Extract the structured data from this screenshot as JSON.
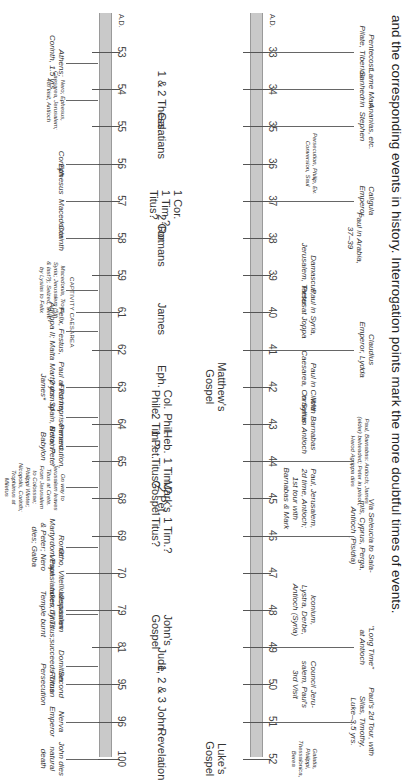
{
  "header": {
    "text": "and the corresponding events in history. Interrogation points mark the more doubtful times of events."
  },
  "timelines": [
    {
      "id": "upper",
      "era_label": "A.D.",
      "years": [
        "33",
        "34",
        "35",
        "36",
        "37",
        "38",
        "39",
        "40",
        "41",
        "42",
        "43",
        "44",
        "45",
        "46",
        "47",
        "48",
        "49",
        "50",
        "51",
        "52"
      ],
      "books": [
        {
          "text": "Matthew's\nGospel",
          "year_index": 9
        },
        {
          "text": "Luke's\nGospel",
          "year_index": 19
        }
      ],
      "events_above": [
        {
          "text": "Pentecost\nPilate, Tiberius",
          "year_index": 0
        },
        {
          "text": "Lame Man,\nSanhedrin",
          "year_index": 1
        },
        {
          "text": "Ananias, etc.\nStephen",
          "year_index": 2
        },
        {
          "text": "Caligula\nEmperor",
          "year_index": 4
        },
        {
          "text": "Claudius\nEmperor, Lydda",
          "year_index": 8
        },
        {
          "text": "Paul, Barnabas: Antioch; James\n(elder) beheaded; Peter in prison;\nHerod Agrippa dies",
          "year_index": 11,
          "small": true
        },
        {
          "text": "Via Seleucia to Sala-\nmis, Cyprus, Perga,\nAntioch (Pisidia)",
          "year_index": 13
        },
        {
          "text": "\"Long Time\"\nat Antioch",
          "year_index": 16
        },
        {
          "text": "Paul's 2d Tour, with\nSilas, Timothy,\nLuke–3.5 yrs.",
          "year_index": 18
        }
      ],
      "events_mid": [
        {
          "text": "Persecution, Philip, Ev.\nConversion, Saul",
          "year_index": 3,
          "small": true
        },
        {
          "text": "Paul in Arabia,\n37–39",
          "year_index": 5
        },
        {
          "text": "Damascus,\nJerusalem, Tarsus",
          "year_index": 6
        },
        {
          "text": "Paul in Syria,\nPeter at Joppa",
          "year_index": 7
        },
        {
          "text": "Paul in Cilicia\nCaesarea, Cornelius",
          "year_index": 9
        },
        {
          "text": "With Barnabas\nin Syrian Antioch",
          "year_index": 10
        },
        {
          "text": "Paul, Jerusalem,\n2d time, Antioch;\n1st tour with\nBarnabas & Mark",
          "year_index": 12
        },
        {
          "text": "Iconium,\nLystra, Derbe,\nAntioch (Syria)",
          "year_index": 15
        },
        {
          "text": "Council Jeru-\nsalem, Paul's\n3rd Visit",
          "year_index": 17
        },
        {
          "text": "Galatia,\nPhilippi,\nThessalonica,\nBerea",
          "year_index": 19,
          "small": true
        }
      ]
    },
    {
      "id": "lower",
      "era_label": "A.D.",
      "years": [
        "53",
        "54",
        "55",
        "56",
        "57",
        "58",
        "59",
        "61",
        "62",
        "63",
        "64",
        "65",
        "68",
        "69",
        "70",
        "79",
        "81",
        "95",
        "96",
        "100"
      ],
      "books": [
        {
          "text": "1 & 2 Thess.",
          "year_index": 1
        },
        {
          "text": "Galatians",
          "year_index": 2
        },
        {
          "text": "1 Cor.\n1 Tim.?\nTitus?",
          "year_index": 4
        },
        {
          "text": "2 Cor.",
          "year_index": 4.6
        },
        {
          "text": "Romans",
          "year_index": 5
        },
        {
          "text": "James",
          "year_index": 7
        },
        {
          "text": "Eph.",
          "year_index": 8.6
        },
        {
          "text": "Col.\nPhile.",
          "year_index": 9.3
        },
        {
          "text": "Phil.\n2 Tim.?",
          "year_index": 10
        },
        {
          "text": "Heb.\n1 Pet.",
          "year_index": 10.4
        },
        {
          "text": "1 Tim.?\nTitus?",
          "year_index": 11.2
        },
        {
          "text": "Mark's\nGospel",
          "year_index": 11.8
        },
        {
          "text": "2 Pet.",
          "year_index": 11.9
        },
        {
          "text": "1 Tim.?\nTitus?",
          "year_index": 12.8
        },
        {
          "text": "John's\nGospel",
          "year_index": 15.4
        },
        {
          "text": "Jude",
          "year_index": 16.2
        },
        {
          "text": "1, 2 & 3 John",
          "year_index": 17
        },
        {
          "text": "Revelation",
          "year_index": 18.6
        }
      ],
      "events_below": [
        {
          "text": "Athens;\nCorinth, 1.5 yrs.",
          "year_index": 0.3
        },
        {
          "text": "Nero; Ephesus,\nCaesarea, Jerusalem;\n4th visit, Antioch",
          "year_index": 1.3,
          "small": true
        },
        {
          "text": "Corinth",
          "year_index": 3
        },
        {
          "text": "Ephesus  Macedonia",
          "year_index": 4
        },
        {
          "text": "Corinth",
          "year_index": 5
        },
        {
          "text": "Macedonia, Troas,\nSyria; Jerusalem (5th\n& last?); Seized, Sent\nby Lysias to Felix",
          "year_index": 6.4,
          "small": true
        },
        {
          "text": "CAPTIVITY CAESAREA",
          "year_index": 7,
          "caps": true
        },
        {
          "text": "Felix, Festus,\nAgrippa II; Malta",
          "year_index": 7.5
        },
        {
          "text": "Paul at Rome;\nMartyrdom of\nJames*",
          "year_index": 9
        },
        {
          "text": "First Imprisonment\n2 yrs. Spain, Britain?",
          "year_index": 9.8
        },
        {
          "text": "Persecution,\nNero; Peter\nBabylon",
          "year_index": 10.6
        },
        {
          "text": "On way to\nJerusalem leaves\nTitus at Crete.\nFrom Jerusalem\nto Colossae;\nPhilippi Winter;\nNicopolis, Corinth;\nTrophimus at\nMiletus",
          "year_index": 11.7,
          "small": true
        },
        {
          "text": "Rome:\nMartyrdom Paul\n& Peter; Nero\ndies; Galba",
          "year_index": 13.3
        },
        {
          "text": "Otho, Vitellius\nVespasian",
          "year_index": 14
        },
        {
          "text": "Vespasian\ndies; Titus",
          "year_index": 15
        },
        {
          "text": "Jerusalem\ntaken by Titus;\nTemple burnt",
          "year_index": 15.1
        },
        {
          "text": "Domitian\nsucceeds Titus",
          "year_index": 16.5
        },
        {
          "text": "Second\nRoman\nPersecution",
          "year_index": 17
        },
        {
          "text": "Nerva\nEmperor",
          "year_index": 18
        },
        {
          "text": "John dies\nnatural\ndeath",
          "year_index": 19
        }
      ]
    }
  ]
}
